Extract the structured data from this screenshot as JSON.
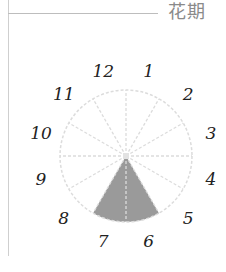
{
  "header": {
    "title": "花期"
  },
  "chart_data": {
    "type": "pie",
    "title": "花期",
    "categories": [
      "1",
      "2",
      "3",
      "4",
      "5",
      "6",
      "7",
      "8",
      "9",
      "10",
      "11",
      "12"
    ],
    "values": [
      0,
      0,
      0,
      0,
      0,
      1,
      1,
      0,
      0,
      0,
      0,
      0
    ],
    "highlighted_months": [
      6,
      7
    ],
    "center": [
      126,
      156
    ],
    "radius": 66,
    "colors": {
      "fill": "#9a9a9a",
      "grid": "#dcdcdc",
      "label": "#222222"
    },
    "legend": null
  }
}
